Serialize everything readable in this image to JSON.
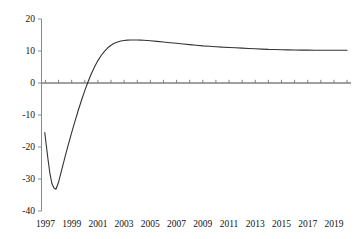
{
  "chart_data": {
    "type": "line",
    "title": "",
    "subtitle": "",
    "xlabel": "",
    "ylabel": "",
    "xlim": [
      1996.7,
      2020.3
    ],
    "ylim": [
      -40,
      20
    ],
    "grid": false,
    "legend": false,
    "legend_position": "none",
    "line_color": "#333333",
    "zero_line_color": "#808080",
    "axis_color": "#888888",
    "y_ticks": [
      20,
      10,
      0,
      -10,
      -20,
      -30,
      -40
    ],
    "y_tick_labels": [
      "20",
      "10",
      "0",
      "-10",
      "-20",
      "-30",
      "-40"
    ],
    "x_ticks": [
      1997,
      1998,
      1999,
      2000,
      2001,
      2002,
      2003,
      2004,
      2005,
      2006,
      2007,
      2008,
      2009,
      2010,
      2011,
      2012,
      2013,
      2014,
      2015,
      2016,
      2017,
      2018,
      2019,
      2020
    ],
    "x_tick_labels": [
      "1997",
      "1999",
      "2001",
      "2003",
      "2005",
      "2007",
      "2009",
      "2011",
      "2013",
      "2015",
      "2017",
      "2019"
    ],
    "x_labeled_ticks": [
      1997,
      1999,
      2001,
      2003,
      2005,
      2007,
      2009,
      2011,
      2013,
      2015,
      2017,
      2019
    ],
    "series": [
      {
        "name": "response",
        "x": [
          1996.95,
          1997.05,
          1997.2,
          1997.35,
          1997.5,
          1997.65,
          1997.8,
          1998.0,
          1998.25,
          1998.5,
          1998.75,
          1999.0,
          1999.25,
          1999.5,
          1999.75,
          2000.0,
          2000.25,
          2000.5,
          2000.75,
          2001.0,
          2001.25,
          2001.5,
          2001.75,
          2002.0,
          2002.25,
          2002.5,
          2002.75,
          2003.0,
          2003.25,
          2003.5,
          2003.75,
          2004.0,
          2004.25,
          2004.5,
          2004.75,
          2005.0,
          2005.5,
          2006.0,
          2006.5,
          2007.0,
          2007.5,
          2008.0,
          2008.5,
          2009.0,
          2009.5,
          2010.0,
          2010.5,
          2011.0,
          2011.5,
          2012.0,
          2012.5,
          2013.0,
          2013.5,
          2014.0,
          2014.5,
          2015.0,
          2015.5,
          2016.0,
          2016.5,
          2017.0,
          2017.5,
          2018.0,
          2018.5,
          2019.0,
          2019.5,
          2020.0
        ],
        "y": [
          -15.5,
          -19.0,
          -24.0,
          -28.5,
          -31.5,
          -32.8,
          -33.2,
          -31.0,
          -27.0,
          -23.0,
          -19.2,
          -15.5,
          -12.0,
          -8.6,
          -5.4,
          -2.4,
          0.4,
          2.9,
          5.1,
          7.0,
          8.6,
          9.9,
          11.0,
          11.8,
          12.4,
          12.8,
          13.1,
          13.3,
          13.4,
          13.45,
          13.45,
          13.45,
          13.4,
          13.35,
          13.3,
          13.2,
          13.0,
          12.8,
          12.6,
          12.4,
          12.2,
          12.0,
          11.8,
          11.6,
          11.5,
          11.35,
          11.2,
          11.1,
          11.0,
          10.9,
          10.8,
          10.7,
          10.6,
          10.5,
          10.45,
          10.4,
          10.35,
          10.3,
          10.28,
          10.26,
          10.25,
          10.24,
          10.23,
          10.22,
          10.22,
          10.22
        ]
      }
    ],
    "annotations": {
      "min_value": -33.2,
      "min_year": 1997.8,
      "peak_value": 13.45,
      "peak_year": 2004.0,
      "zero_crossing_year": 2000.2,
      "final_value": 10.22
    }
  },
  "axes": {
    "y_axis_name": "y-axis",
    "x_axis_name": "x-axis"
  }
}
